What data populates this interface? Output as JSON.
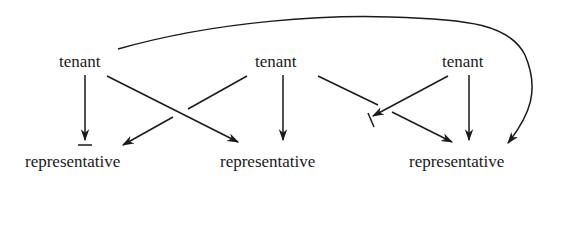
{
  "diagram": {
    "top_nodes": [
      {
        "id": "t1",
        "label": "tenant"
      },
      {
        "id": "t2",
        "label": "tenant"
      },
      {
        "id": "t3",
        "label": "tenant"
      }
    ],
    "bottom_nodes": [
      {
        "id": "r1",
        "label": "representative"
      },
      {
        "id": "r2",
        "label": "representative"
      },
      {
        "id": "r3",
        "label": "representative"
      }
    ],
    "edges": [
      {
        "from": "t1",
        "to": "r1",
        "type": "blocked-arrow"
      },
      {
        "from": "t1",
        "to": "r2",
        "type": "arrow"
      },
      {
        "from": "t1",
        "to": "r3",
        "type": "curved-arrow"
      },
      {
        "from": "t2",
        "to": "r1",
        "type": "arrow"
      },
      {
        "from": "t2",
        "to": "r2",
        "type": "arrow"
      },
      {
        "from": "t2",
        "to": "r3",
        "type": "arrow"
      },
      {
        "from": "t3",
        "to": "blocked-point",
        "type": "blocked-arrow"
      },
      {
        "from": "t3",
        "to": "r3",
        "type": "arrow"
      }
    ],
    "colors": {
      "ink": "#1a1a1a",
      "background": "#ffffff"
    }
  }
}
